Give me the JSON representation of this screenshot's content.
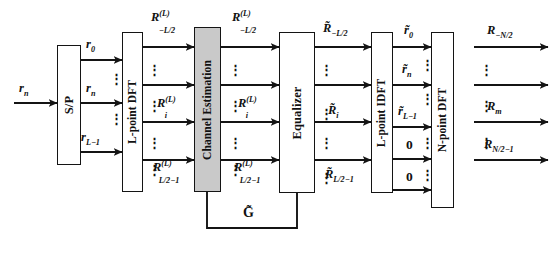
{
  "figure": {
    "type": "block-diagram",
    "background": "#ffffff",
    "line_color": "#141414",
    "shaded_fill": "#c9c9c9"
  },
  "blocks": [
    {
      "id": "sp",
      "label": "S/P",
      "shaded": false
    },
    {
      "id": "ldft",
      "label": "L-point DFT",
      "shaded": false
    },
    {
      "id": "chest",
      "label": "Channel Estimation",
      "shaded": true
    },
    {
      "id": "equalizer",
      "label": "Equalizer",
      "shaded": false
    },
    {
      "id": "lidft",
      "label": "L-point IDFT",
      "shaded": false
    },
    {
      "id": "ndft",
      "label": "N-point DFT",
      "shaded": false
    }
  ],
  "signals": {
    "input": "r_n",
    "sp_outputs": [
      "r_0",
      "r_n",
      "r_L-1"
    ],
    "dft_outputs": [
      "R^(L)_-L/2",
      "R^(L)_i",
      "R^(L)_L/2-1"
    ],
    "chest_outputs": [
      "R^(L)_-L/2",
      "R^(L)_i",
      "R^(L)_L/2-1"
    ],
    "equalizer_outputs": [
      "R~_-L/2",
      "R~_i",
      "R~_L/2-1"
    ],
    "idft_outputs": [
      "r~_0",
      "r~_n",
      "r~_L-1"
    ],
    "zero_pads": [
      "0",
      "0"
    ],
    "final_outputs": [
      "R_-N/2",
      "R_m",
      "R_N/2-1"
    ],
    "feedback": "G~"
  },
  "labels": {
    "input_rn": "r",
    "input_rn_sub": "n",
    "sp_r0": "r",
    "sp_r0_sub": "0",
    "sp_rn": "r",
    "sp_rn_sub": "n",
    "sp_rL1": "r",
    "sp_rL1_sub": "L−1",
    "R_base": "R",
    "R_sup_L": "(L)",
    "R_sub_negL2": "−L/2",
    "R_sub_i": "i",
    "R_sub_L2m1": "L/2−1",
    "Rt_base": "R̃",
    "Rt_sub_negL2": "−L/2",
    "Rt_sub_i": "i",
    "Rt_sub_L2m1": "L/2−1",
    "rt_base": "r̃",
    "rt_sub_0": "0",
    "rt_sub_n": "n",
    "rt_sub_L1": "L−1",
    "out_base": "R",
    "out_sub_negN2": "−N/2",
    "out_sub_m": "m",
    "out_sub_N2m1": "N/2−1",
    "zero": "0",
    "gtilde": "G̃",
    "dots": "⋮"
  },
  "block_labels": {
    "sp": "S/P",
    "ldft": "L-point DFT",
    "chest": "Channel Estimation",
    "equalizer": "Equalizer",
    "lidft": "L-point IDFT",
    "ndft": "N-point DFT"
  }
}
